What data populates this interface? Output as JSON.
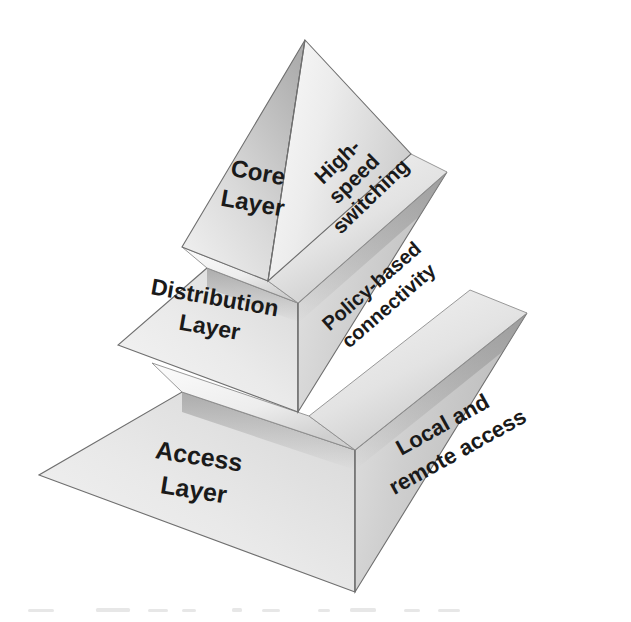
{
  "diagram": {
    "type": "three-tier-pyramid",
    "background_color": "#ffffff",
    "tiers": [
      {
        "id": "core",
        "position": "top",
        "left_face_label": "Core\nLayer",
        "left_face_label_line1": "Core",
        "left_face_label_line2": "Layer",
        "right_face_label_line1": "High-",
        "right_face_label_line2": "speed",
        "right_face_label_line3": "switching",
        "left_face_color": "#d4d4d4",
        "right_face_color": "#e6e6e6",
        "top_slab_color": "#f0f0f0"
      },
      {
        "id": "distribution",
        "position": "middle",
        "left_face_label_line1": "Distribution",
        "left_face_label_line2": "Layer",
        "right_face_label_line1": "Policy-based",
        "right_face_label_line2": "connectivity",
        "left_face_color": "#e7e7e7",
        "right_face_color": "#c9c9c9",
        "top_slab_color": "#efefef"
      },
      {
        "id": "access",
        "position": "bottom",
        "left_face_label_line1": "Access",
        "left_face_label_line2": "Layer",
        "right_face_label_line1": "Local and",
        "right_face_label_line2": "remote access",
        "left_face_color": "#e8e8e8",
        "right_face_color": "#c6c6c6",
        "top_slab_color": "#f2f2f2"
      }
    ],
    "colors": {
      "edge_stroke": "#6f6f6f",
      "text": "#1a1a1a",
      "left_face_light": "#f2f2f2",
      "left_face_dark": "#d2d2d2",
      "right_face_light": "#dcdcdc",
      "right_face_dark": "#b4b4b4",
      "slab_highlight": "#fafafa",
      "slab_shadow": "#b8b8b8"
    }
  }
}
